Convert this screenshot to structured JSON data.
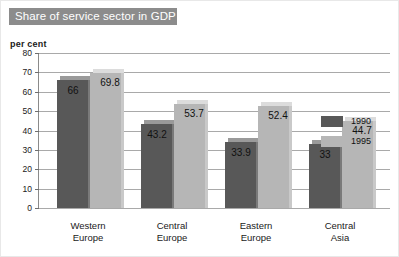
{
  "title": "Share of service sector in GDP",
  "unit_label": "per cent",
  "legend": {
    "items": [
      {
        "label": "1990",
        "color": "#585858"
      },
      {
        "label": "1995",
        "color": "#b6b6b6"
      }
    ]
  },
  "chart_data": {
    "type": "bar",
    "title": "Share of service sector in GDP",
    "xlabel": "",
    "ylabel": "per cent",
    "ylim": [
      0,
      80
    ],
    "ytick_labels": [
      "80",
      "70",
      "60",
      "50",
      "40",
      "30",
      "20",
      "10",
      "0"
    ],
    "ytick_values": [
      80,
      70,
      60,
      50,
      40,
      30,
      20,
      10,
      0
    ],
    "grid": true,
    "legend_position": "top-right",
    "categories": [
      "Western Europe",
      "Central Europe",
      "Eastern Europe",
      "Central Asia"
    ],
    "category_lines": [
      [
        "Western",
        "Europe"
      ],
      [
        "Central",
        "Europe"
      ],
      [
        "Eastern",
        "Europe"
      ],
      [
        "Central",
        "Asia"
      ]
    ],
    "series": [
      {
        "name": "1990",
        "color": "#585858",
        "values": [
          66,
          43.2,
          33.9,
          33
        ],
        "labels": [
          "66",
          "43.2",
          "33.9",
          "33"
        ]
      },
      {
        "name": "1995",
        "color": "#b6b6b6",
        "values": [
          69.8,
          53.7,
          52.4,
          44.7
        ],
        "labels": [
          "69.8",
          "53.7",
          "52.4",
          "44.7"
        ]
      }
    ]
  }
}
